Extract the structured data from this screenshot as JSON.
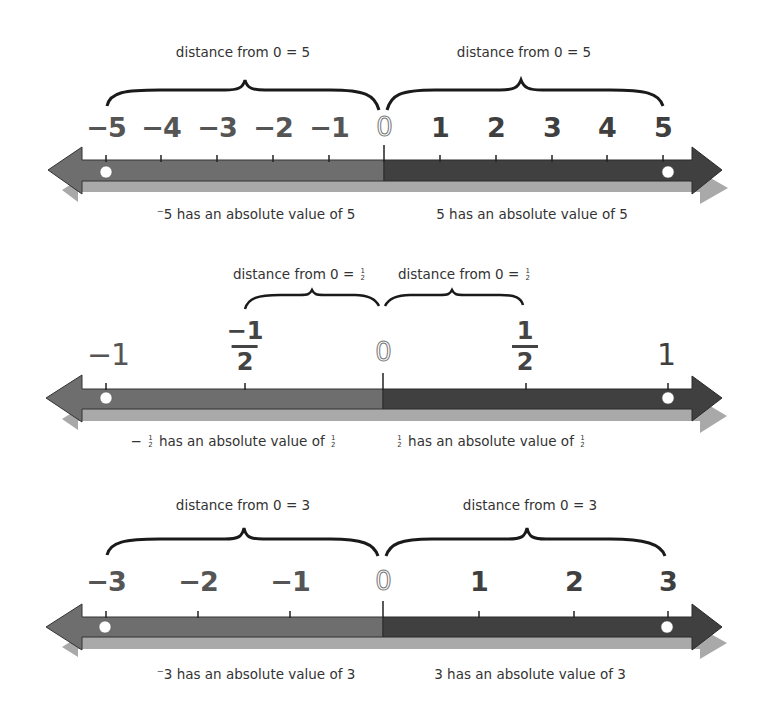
{
  "colors": {
    "negative_bar": "#6e6e6e",
    "positive_bar": "#404040",
    "shadow": "#a9a9a9",
    "tick": "#222222",
    "brace": "#1a1a1a",
    "point": "#ffffff",
    "number_text": "#555555"
  },
  "panels": [
    {
      "id": "five",
      "left_label": "distance from 0 = 5",
      "right_label": "distance from 0 = 5",
      "ticks": [
        "−5",
        "−4",
        "−3",
        "−2",
        "−1",
        "0",
        "1",
        "2",
        "3",
        "4",
        "5"
      ],
      "points": [
        "−5",
        "5"
      ],
      "left_caption": "⁻5 has an absolute value of 5",
      "right_caption": "5 has an absolute value of 5"
    },
    {
      "id": "half",
      "left_label_prefix": "distance from 0 =",
      "left_label_frac": {
        "num": "1",
        "den": "2"
      },
      "right_label_prefix": "distance from 0 =",
      "right_label_frac": {
        "num": "1",
        "den": "2"
      },
      "ticks": [
        "−1",
        "−1/2",
        "0",
        "1/2",
        "1"
      ],
      "tick_parts": {
        "neg_one": "−1",
        "neg_half_num": "−1",
        "neg_half_den": "2",
        "zero": "0",
        "half_num": "1",
        "half_den": "2",
        "one": "1"
      },
      "points": [
        "−1",
        "1"
      ],
      "left_caption_prefix": "−",
      "left_caption_frac": {
        "num": "1",
        "den": "2"
      },
      "left_caption_text": "has an absolute value of",
      "right_caption_frac": {
        "num": "1",
        "den": "2"
      },
      "right_caption_text": "has an absolute value of"
    },
    {
      "id": "three",
      "left_label": "distance from 0 = 3",
      "right_label": "distance from 0 = 3",
      "ticks": [
        "−3",
        "−2",
        "−1",
        "0",
        "1",
        "2",
        "3"
      ],
      "points": [
        "−3",
        "3"
      ],
      "left_caption": "⁻3 has an absolute value of 3",
      "right_caption": "3 has an absolute value of 3"
    }
  ]
}
